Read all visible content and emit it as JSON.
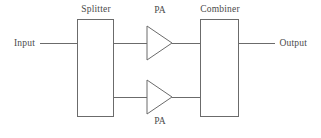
{
  "diagram": {
    "background_color": "#ffffff",
    "stroke_color": "#6b6b6b",
    "text_color": "#4a4a4a",
    "stroke_width": 1,
    "width": 321,
    "height": 138
  },
  "labels": {
    "input": "Input",
    "splitter": "Splitter",
    "pa_top": "PA",
    "pa_bottom": "PA",
    "combiner": "Combiner",
    "output": "Output"
  },
  "blocks": [
    {
      "name": "splitter",
      "label": "Splitter",
      "x": 77,
      "y": 19,
      "width": 36,
      "height": 97
    },
    {
      "name": "combiner",
      "label": "Combiner",
      "x": 200,
      "y": 19,
      "width": 38,
      "height": 97
    }
  ],
  "amplifiers": [
    {
      "name": "pa-top",
      "label": "PA",
      "apex_x": 172,
      "base_x": 147,
      "center_y": 43,
      "half_height": 17
    },
    {
      "name": "pa-bottom",
      "label": "PA",
      "apex_x": 172,
      "base_x": 147,
      "center_y": 97,
      "half_height": 17
    }
  ],
  "connections": [
    {
      "name": "input-line",
      "x1": 40,
      "y1": 43,
      "x2": 77,
      "y2": 43
    },
    {
      "name": "splitter-to-pa-top",
      "x1": 113,
      "y1": 43,
      "x2": 147,
      "y2": 43
    },
    {
      "name": "pa-top-to-combiner",
      "x1": 172,
      "y1": 43,
      "x2": 200,
      "y2": 43
    },
    {
      "name": "splitter-to-pa-bottom",
      "x1": 113,
      "y1": 97,
      "x2": 147,
      "y2": 97
    },
    {
      "name": "pa-bottom-to-combiner",
      "x1": 172,
      "y1": 97,
      "x2": 200,
      "y2": 97
    },
    {
      "name": "output-line",
      "x1": 238,
      "y1": 43,
      "x2": 275,
      "y2": 43
    }
  ],
  "label_positions": {
    "input": {
      "x": 14,
      "y": 39,
      "align": "left"
    },
    "splitter": {
      "x": 96,
      "y": 5,
      "align": "center"
    },
    "pa_top": {
      "x": 160,
      "y": 6,
      "align": "center"
    },
    "combiner": {
      "x": 220,
      "y": 5,
      "align": "center"
    },
    "pa_bottom": {
      "x": 160,
      "y": 117,
      "align": "center"
    },
    "output": {
      "x": 307,
      "y": 39,
      "align": "right"
    }
  }
}
